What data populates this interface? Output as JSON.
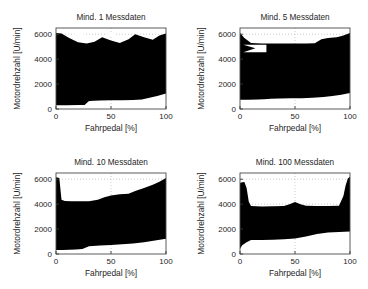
{
  "figure": {
    "background": "#ffffff",
    "band_color": "#000000",
    "axis_color": "#4a4a4a",
    "grid_color": "#b6b6b6",
    "width": 368,
    "height": 289
  },
  "panels": [
    {
      "id": "panel-min-1",
      "title": "Mind. 1 Messdaten",
      "x": 0,
      "y": 0,
      "chart_data": {
        "type": "area",
        "title": "Mind. 1 Messdaten",
        "xlabel": "Fahrpedal [%]",
        "ylabel": "Motordrehzahl [U/min]",
        "xlim": [
          0,
          100
        ],
        "ylim": [
          0,
          6500
        ],
        "xticks": [
          0,
          50,
          100
        ],
        "xticklabels": [
          "0",
          "50",
          "100"
        ],
        "yticks": [
          0,
          2000,
          4000,
          6000
        ],
        "yticklabels": [
          "0",
          "2000",
          "4000",
          "6000"
        ],
        "grid": true,
        "legend": "none",
        "series": [
          {
            "name": "upper envelope",
            "x": [
              0,
              5,
              12,
              20,
              28,
              35,
              42,
              50,
              58,
              66,
              72,
              80,
              88,
              94,
              100
            ],
            "values": [
              6100,
              6050,
              5700,
              5350,
              5250,
              5400,
              5750,
              5500,
              5300,
              5600,
              6000,
              5750,
              5550,
              5900,
              6050
            ]
          },
          {
            "name": "lower envelope",
            "x": [
              0,
              10,
              20,
              26,
              30,
              40,
              50,
              60,
              70,
              78,
              85,
              92,
              100
            ],
            "values": [
              300,
              310,
              320,
              330,
              650,
              680,
              700,
              710,
              720,
              760,
              900,
              1050,
              1250
            ]
          }
        ],
        "holes": [
          {
            "name": "hole-1",
            "cx": 21,
            "cy": 5950,
            "rx": 5.0,
            "ry": 190
          },
          {
            "name": "hole-2",
            "cx": 50,
            "cy": 5950,
            "rx": 4.6,
            "ry": 185
          }
        ]
      }
    },
    {
      "id": "panel-min-5",
      "title": "Mind. 5 Messdaten",
      "x": 184,
      "y": 0,
      "chart_data": {
        "type": "area",
        "title": "Mind. 5 Messdaten",
        "xlabel": "Fahrpedal [%]",
        "ylabel": "Motordrehzahl [U/min]",
        "xlim": [
          0,
          100
        ],
        "ylim": [
          0,
          6500
        ],
        "xticks": [
          0,
          50,
          100
        ],
        "xticklabels": [
          "0",
          "50",
          "100"
        ],
        "yticks": [
          0,
          2000,
          4000,
          6000
        ],
        "yticklabels": [
          "0",
          "2000",
          "4000",
          "6000"
        ],
        "grid": true,
        "legend": "none",
        "series": [
          {
            "name": "upper envelope",
            "x": [
              0,
              4,
              10,
              20,
              30,
              40,
              50,
              60,
              68,
              74,
              80,
              88,
              94,
              100
            ],
            "values": [
              6100,
              5700,
              5300,
              5250,
              5250,
              5250,
              5250,
              5250,
              5280,
              5600,
              5700,
              5750,
              5900,
              6100
            ]
          },
          {
            "name": "lower envelope",
            "x": [
              0,
              8,
              16,
              22,
              28,
              36,
              46,
              56,
              66,
              76,
              84,
              92,
              100
            ],
            "values": [
              740,
              750,
              760,
              790,
              830,
              850,
              860,
              870,
              900,
              960,
              1040,
              1150,
              1280
            ]
          }
        ],
        "holes": [
          {
            "name": "notch-wedge",
            "points": "3,5150 14,4880 3,4550 24,4550 24,5150"
          }
        ]
      }
    },
    {
      "id": "panel-min-10",
      "title": "Mind. 10 Messdaten",
      "x": 0,
      "y": 145,
      "chart_data": {
        "type": "area",
        "title": "Mind. 10 Messdaten",
        "xlabel": "Fahrpedal [%]",
        "ylabel": "Motordrehzahl [U/min]",
        "xlim": [
          0,
          100
        ],
        "ylim": [
          0,
          6500
        ],
        "xticks": [
          0,
          50,
          100
        ],
        "xticklabels": [
          "0",
          "50",
          "100"
        ],
        "yticks": [
          0,
          2000,
          4000,
          6000
        ],
        "yticklabels": [
          "0",
          "2000",
          "4000",
          "6000"
        ],
        "grid": true,
        "legend": "none",
        "series": [
          {
            "name": "upper envelope",
            "x": [
              0,
              3,
              5,
              8,
              14,
              22,
              30,
              38,
              44,
              50,
              58,
              66,
              72,
              80,
              88,
              94,
              100
            ],
            "values": [
              6150,
              6100,
              4350,
              4250,
              4230,
              4230,
              4240,
              4350,
              4550,
              4700,
              4800,
              4830,
              5050,
              5300,
              5550,
              5800,
              6100
            ]
          },
          {
            "name": "lower envelope",
            "x": [
              0,
              6,
              12,
              18,
              24,
              30,
              40,
              50,
              60,
              70,
              80,
              90,
              100
            ],
            "values": [
              320,
              330,
              340,
              360,
              400,
              630,
              680,
              720,
              780,
              850,
              950,
              1080,
              1230
            ]
          }
        ],
        "holes": [
          {
            "name": "hole-1",
            "cx": 40,
            "cy": 4950,
            "rx": 4.4,
            "ry": 175
          }
        ]
      }
    },
    {
      "id": "panel-min-100",
      "title": "Mind. 100 Messdaten",
      "x": 184,
      "y": 145,
      "chart_data": {
        "type": "area",
        "title": "Mind. 100 Messdaten",
        "xlabel": "Fahrpedal [%]",
        "ylabel": "Motordrehzahl [U/min]",
        "xlim": [
          0,
          100
        ],
        "ylim": [
          0,
          6500
        ],
        "xticks": [
          0,
          50,
          100
        ],
        "xticklabels": [
          "0",
          "50",
          "100"
        ],
        "yticks": [
          0,
          2000,
          4000,
          6000
        ],
        "yticklabels": [
          "0",
          "2000",
          "4000",
          "6000"
        ],
        "grid": true,
        "legend": "none",
        "series": [
          {
            "name": "upper envelope",
            "x": [
              0,
              2,
              4,
              6,
              8,
              10,
              20,
              30,
              40,
              45,
              50,
              55,
              60,
              70,
              80,
              90,
              94,
              96,
              98,
              100
            ],
            "values": [
              5700,
              5750,
              5780,
              5300,
              4200,
              3850,
              3820,
              3830,
              3850,
              4000,
              4180,
              4000,
              3880,
              3850,
              3850,
              3880,
              4650,
              5500,
              6050,
              6200
            ]
          },
          {
            "name": "lower envelope",
            "x": [
              0,
              2,
              6,
              10,
              20,
              30,
              40,
              50,
              60,
              70,
              80,
              90,
              100
            ],
            "values": [
              430,
              700,
              950,
              1120,
              1130,
              1150,
              1180,
              1250,
              1400,
              1600,
              1720,
              1760,
              1800
            ]
          }
        ],
        "holes": []
      }
    }
  ]
}
